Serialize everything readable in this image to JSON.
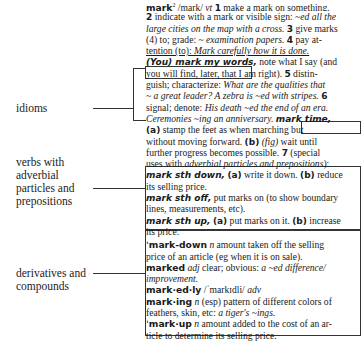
{
  "labels": {
    "idioms": "idioms",
    "verbs": [
      "verbs with",
      "adverbial",
      "particles and",
      "prepositions"
    ],
    "derivatives": [
      "derivatives and",
      "compounds"
    ]
  },
  "entry": {
    "headword": "mark",
    "superscript": "2",
    "pron": "/mark/",
    "pos": "vt",
    "lines": {
      "l1_s1": "1",
      "l1_text": " make a mark on something.",
      "l2_s2": "2",
      "l2_text": " indicate with a mark or visible sign: ",
      "l2_ex": "~ed all the",
      "l3_ex": "large cities on the map with a cross.",
      "l3_s3": "3",
      "l3_text": " give marks",
      "l4_text": "(4) to; grade: ~ ",
      "l4_ex": "examination papers.",
      "l4_s4": "4",
      "l4_text2": " pay at-",
      "l5_u": "tention (to): ",
      "l5_ex": "Mark carefully how it is done.",
      "l6_idiom": "(You) mark my words,",
      "l6_text": " note what I say (and",
      "l7_text": "you will find, later, that I am right).",
      "l7_s5": "5",
      "l7_text2": " distin-",
      "l8_text": "guish; characterize: ",
      "l8_ex": "What are the qualities that",
      "l9_ex": "~ a great leader? A zebra is ~ed with stripes.",
      "l9_s6": "6",
      "l10_text": "signal; denote: ",
      "l10_ex": "His death ~ed the end of an era.",
      "l11_ex": "Ceremonies ~ing an anniversary.",
      "l11_idiom": "mark time,",
      "l12_a": "(a)",
      "l12_text": " stamp the feet as when marching but",
      "l13_text": "without moving forward. ",
      "l13_b": "(b)",
      "l13_fig": "(fig)",
      "l13_text2": " wait until",
      "l14_text": "further progress becomes possible.",
      "l14_s7": "7",
      "l14_text2": " (special",
      "l15_text": "uses with ",
      "l15_ex": "adverbial particles and prepositions",
      "l15_end": "):",
      "l16_pv": "mark sth down,",
      "l16_a": "(a)",
      "l16_text": " write it down. ",
      "l16_b": "(b)",
      "l16_text2": " reduce",
      "l17_text": "its selling price.",
      "l18_pv": "mark sth off,",
      "l18_text": " put marks on (to show boundary",
      "l19_text": "lines, measurements, etc).",
      "l20_pv": "mark sth up,",
      "l20_a": "(a)",
      "l20_text": " put marks on it. ",
      "l20_b": "(b)",
      "l20_text2": " increase",
      "l21_text": "its price.",
      "l22_hw": "ˈmark-down",
      "l22_pos": "n",
      "l22_text": " amount taken off the selling",
      "l23_text": "price of an article (eg when it is on sale).",
      "l24_hw": "marked",
      "l24_pos": "adj",
      "l24_text": " clear; obvious: ",
      "l24_ex": "a ~ed difference/",
      "l25_ex": "improvement.",
      "l26_hw": "mark·ed·ly",
      "l26_pron": " /ˈmarkɪdli/ ",
      "l26_pos": "adv",
      "l27_hw": "mark·ing",
      "l27_pos": "n",
      "l27_text": " (esp) pattern of different colors of",
      "l28_text": "feathers, skin, etc: ",
      "l28_ex": "a tiger's ~ings.",
      "l29_hw": "ˈmark·up",
      "l29_pos": "n",
      "l29_text": " amount added to the cost of an ar-",
      "l30_text": "ticle to determine its selling price."
    }
  }
}
